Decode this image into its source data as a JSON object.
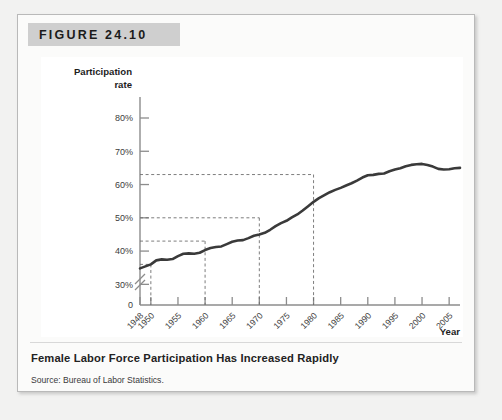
{
  "figure": {
    "header_label": "FIGURE 24.10",
    "caption_title": "Female Labor Force Participation Has Increased Rapidly",
    "caption_source": "Source: Bureau of Labor Statistics."
  },
  "colors": {
    "page_background": "#f2f2f1",
    "card_background": "#fbfbfa",
    "card_border": "#b9b9b9",
    "header_band": "#cfcfcf",
    "plot_background": "#ffffff",
    "axis": "#8c8c8c",
    "series_line": "#3a3a3a",
    "guide_line": "#6e6e6e",
    "tick_label": "#3c3c3c",
    "caption_text": "#222222"
  },
  "chart_data": {
    "type": "line",
    "title": "Female Labor Force Participation Has Increased Rapidly",
    "xlabel": "Year",
    "ylabel": "Participation rate",
    "ylabel_line1": "Participation",
    "ylabel_line2": "rate",
    "xlim": [
      1948,
      2007
    ],
    "ylim": [
      28,
      82
    ],
    "axis_break": true,
    "grid": false,
    "legend": false,
    "ytick_labels": [
      "80%",
      "70%",
      "60%",
      "50%",
      "40%",
      "30%",
      "0"
    ],
    "ytick_values": [
      80,
      70,
      60,
      50,
      40,
      30
    ],
    "origin_label": "0",
    "xtick_labels": [
      "1948",
      "1950",
      "1955",
      "1960",
      "1965",
      "1970",
      "1975",
      "1980",
      "1985",
      "1990",
      "1995",
      "2000",
      "2005"
    ],
    "xtick_values": [
      1948,
      1950,
      1955,
      1960,
      1965,
      1970,
      1975,
      1980,
      1985,
      1990,
      1995,
      2000,
      2005
    ],
    "guides": [
      {
        "year": 1950,
        "rate": 36.0
      },
      {
        "year": 1960,
        "rate": 43.0
      },
      {
        "year": 1970,
        "rate": 50.0
      },
      {
        "year": 1980,
        "rate": 63.0
      }
    ],
    "series": [
      {
        "name": "Female labor force participation rate",
        "x": [
          1948,
          1949,
          1950,
          1951,
          1952,
          1953,
          1954,
          1955,
          1956,
          1957,
          1958,
          1959,
          1960,
          1961,
          1962,
          1963,
          1964,
          1965,
          1966,
          1967,
          1968,
          1969,
          1970,
          1971,
          1972,
          1973,
          1974,
          1975,
          1976,
          1977,
          1978,
          1979,
          1980,
          1981,
          1982,
          1983,
          1984,
          1985,
          1986,
          1987,
          1988,
          1989,
          1990,
          1991,
          1992,
          1993,
          1994,
          1995,
          1996,
          1997,
          1998,
          1999,
          2000,
          2001,
          2002,
          2003,
          2004,
          2005,
          2006,
          2007
        ],
        "values": [
          34.8,
          35.4,
          36.0,
          37.2,
          37.5,
          37.4,
          37.6,
          38.5,
          39.2,
          39.3,
          39.2,
          39.5,
          40.3,
          40.9,
          41.2,
          41.4,
          42.1,
          42.8,
          43.2,
          43.3,
          43.9,
          44.6,
          45.0,
          45.5,
          46.4,
          47.5,
          48.4,
          49.1,
          50.1,
          51.0,
          52.2,
          53.5,
          54.8,
          55.9,
          56.8,
          57.7,
          58.4,
          59.0,
          59.7,
          60.4,
          61.2,
          62.1,
          62.8,
          62.9,
          63.2,
          63.3,
          64.0,
          64.5,
          64.9,
          65.5,
          65.9,
          66.1,
          66.2,
          65.9,
          65.4,
          64.7,
          64.5,
          64.6,
          64.9,
          65.0
        ]
      }
    ],
    "normalized_series_note": "plotted percentages",
    "plot_values_display": [
      34.8,
      36.0,
      43.0,
      50.0,
      63.0,
      76.5,
      75.0
    ]
  }
}
